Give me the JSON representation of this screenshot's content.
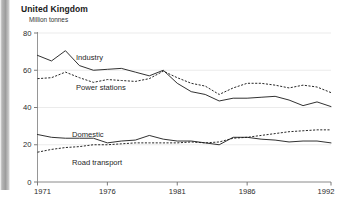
{
  "header": {
    "title": "United Kingdom",
    "subtitle": "Million tonnes"
  },
  "gutter": {
    "name": "page-edge-shadow"
  },
  "chart_data": {
    "type": "line",
    "title": "United Kingdom",
    "subtitle": "Million tonnes",
    "xlabel": "",
    "ylabel": "Million tonnes",
    "ylim": [
      0,
      80
    ],
    "xlim": [
      1971,
      1992
    ],
    "yticks": [
      0,
      20,
      40,
      60,
      80
    ],
    "xticks": [
      1971,
      1976,
      1981,
      1986,
      1992
    ],
    "grid": true,
    "legend": "inline-annotations",
    "x": [
      1971,
      1972,
      1973,
      1974,
      1975,
      1976,
      1977,
      1978,
      1979,
      1980,
      1981,
      1982,
      1983,
      1984,
      1985,
      1986,
      1987,
      1988,
      1989,
      1990,
      1991,
      1992
    ],
    "series": [
      {
        "name": "Industry",
        "style": "solid",
        "values": [
          68,
          65,
          70.5,
          62.5,
          60,
          60.5,
          61,
          59,
          57,
          60,
          53,
          48.5,
          47,
          43.5,
          45,
          45,
          45.5,
          46,
          44,
          41,
          43,
          40.5
        ]
      },
      {
        "name": "Power stations",
        "style": "dashed",
        "values": [
          55.5,
          56,
          59,
          56,
          53.5,
          55,
          54.5,
          54,
          55.5,
          59.5,
          56,
          53,
          51.5,
          47,
          50.5,
          53,
          53,
          52,
          50.5,
          52,
          51,
          48
        ]
      },
      {
        "name": "Domestic",
        "style": "solid",
        "values": [
          25.5,
          24,
          23.5,
          23.5,
          23.5,
          21,
          22,
          22.5,
          25,
          23,
          22,
          22,
          21,
          20,
          24,
          24,
          23,
          22.5,
          21.5,
          22,
          22,
          21
        ]
      },
      {
        "name": "Road transport",
        "style": "dashed",
        "values": [
          16,
          17.5,
          18.5,
          19,
          20,
          20,
          20.5,
          21,
          21,
          21,
          21,
          21.5,
          21,
          21.5,
          23.5,
          24,
          25,
          26,
          27,
          27.5,
          28,
          28
        ]
      }
    ]
  },
  "annotations": [
    {
      "label": "Industry",
      "x": 76,
      "y": 60
    },
    {
      "label": "Power stations",
      "x": 76,
      "y": 90
    },
    {
      "label": "Domestic",
      "x": 72,
      "y": 137
    },
    {
      "label": "Road transport",
      "x": 72,
      "y": 165
    }
  ]
}
